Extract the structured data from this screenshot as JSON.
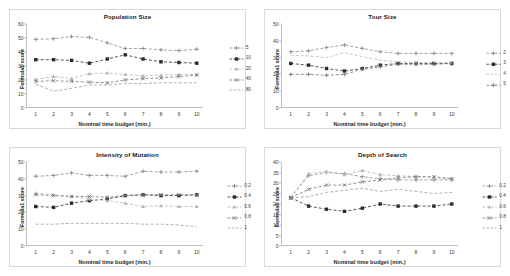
{
  "figure": {
    "background": "#ffffff",
    "panel_border": "#d9d9d9",
    "axis_color": "#bfbfbf",
    "shared_xlabel": "Nominal time budget (min.)",
    "shared_ylabel": "Formula1 score",
    "x_categories": [
      1,
      2,
      3,
      4,
      5,
      6,
      7,
      8,
      9,
      10
    ]
  },
  "chart_data": [
    {
      "type": "line",
      "title": "Population Size",
      "xlabel": "Nominal time budget (min.)",
      "ylabel": "Formula1 score",
      "x": [
        1,
        2,
        3,
        4,
        5,
        6,
        7,
        8,
        9,
        10
      ],
      "xlim": [
        1,
        10
      ],
      "ylim": [
        0,
        60
      ],
      "yticks": [
        0,
        10,
        20,
        30,
        40,
        50,
        60
      ],
      "grid": false,
      "legend_position": "right",
      "series": [
        {
          "name": "5",
          "color": "#8a8a8a",
          "marker": "plus",
          "values": [
            49.0,
            49.5,
            51.0,
            50.5,
            46.5,
            42.5,
            42.5,
            41.5,
            41.0,
            42.0
          ]
        },
        {
          "name": "10",
          "color": "#2b2b2b",
          "marker": "square",
          "values": [
            34.5,
            34.5,
            34.0,
            32.0,
            35.0,
            38.0,
            35.0,
            33.0,
            32.5,
            32.0
          ]
        },
        {
          "name": "20",
          "color": "#b5b5b5",
          "marker": "triangle",
          "values": [
            20.5,
            22.5,
            21.0,
            24.5,
            25.0,
            24.0,
            23.0,
            23.5,
            24.0,
            24.0
          ]
        },
        {
          "name": "40",
          "color": "#777777",
          "marker": "cross",
          "values": [
            19.0,
            19.5,
            19.0,
            18.5,
            18.0,
            20.0,
            21.0,
            21.5,
            22.5,
            23.5
          ]
        },
        {
          "name": "80",
          "color": "#9d9d9d",
          "marker": "none",
          "values": [
            17.0,
            12.0,
            14.0,
            16.5,
            16.5,
            17.5,
            17.5,
            18.0,
            18.0,
            18.0
          ]
        }
      ]
    },
    {
      "type": "line",
      "title": "Tour Size",
      "xlabel": "Nominal time budget (min.)",
      "ylabel": "Formula1 score",
      "x": [
        1,
        2,
        3,
        4,
        5,
        6,
        7,
        8,
        9,
        10
      ],
      "xlim": [
        1,
        10
      ],
      "ylim": [
        0,
        50
      ],
      "yticks": [
        0,
        10,
        20,
        30,
        40,
        50
      ],
      "grid": false,
      "legend_position": "right",
      "series": [
        {
          "name": "2",
          "color": "#8a8a8a",
          "marker": "plus",
          "values": [
            33.5,
            34.0,
            36.0,
            37.5,
            35.5,
            33.5,
            32.5,
            32.5,
            32.5,
            32.5
          ]
        },
        {
          "name": "3",
          "color": "#2b2b2b",
          "marker": "square",
          "values": [
            26.5,
            25.5,
            23.5,
            22.0,
            23.5,
            25.5,
            26.5,
            26.5,
            26.5,
            26.5
          ]
        },
        {
          "name": "4",
          "color": "#b5b5b5",
          "marker": "none",
          "values": [
            31.5,
            31.0,
            30.0,
            33.0,
            30.5,
            28.5,
            27.5,
            27.0,
            27.0,
            27.0
          ]
        },
        {
          "name": "5",
          "color": "#777777",
          "marker": "plus",
          "values": [
            20.0,
            20.0,
            19.5,
            20.0,
            23.0,
            24.5,
            26.0,
            26.0,
            26.0,
            26.5
          ]
        }
      ]
    },
    {
      "type": "line",
      "title": "Intensity of Mutation",
      "xlabel": "Nominal time budget (min.)",
      "ylabel": "Formula1 score",
      "x": [
        1,
        2,
        3,
        4,
        5,
        6,
        7,
        8,
        9,
        10
      ],
      "xlim": [
        1,
        10
      ],
      "ylim": [
        0,
        50
      ],
      "yticks": [
        0,
        10,
        20,
        30,
        40,
        50
      ],
      "grid": false,
      "legend_position": "right",
      "series": [
        {
          "name": "0.2",
          "color": "#8a8a8a",
          "marker": "plus",
          "values": [
            41.5,
            42.0,
            43.5,
            42.0,
            42.0,
            41.5,
            44.5,
            44.0,
            44.0,
            44.5
          ]
        },
        {
          "name": "0.4",
          "color": "#2b2b2b",
          "marker": "square",
          "values": [
            23.5,
            23.0,
            25.5,
            27.0,
            28.0,
            30.0,
            30.5,
            30.0,
            30.0,
            30.5
          ]
        },
        {
          "name": "0.6",
          "color": "#b5b5b5",
          "marker": "triangle",
          "values": [
            31.5,
            30.5,
            29.5,
            28.0,
            27.0,
            25.5,
            23.5,
            24.0,
            23.5,
            23.5
          ]
        },
        {
          "name": "0.8",
          "color": "#777777",
          "marker": "cross",
          "values": [
            30.5,
            30.0,
            29.5,
            29.5,
            29.0,
            30.0,
            30.5,
            30.5,
            30.5,
            30.5
          ]
        },
        {
          "name": "1",
          "color": "#9d9d9d",
          "marker": "none",
          "values": [
            13.0,
            13.0,
            13.5,
            13.5,
            13.5,
            13.5,
            13.0,
            13.0,
            12.5,
            11.5
          ]
        }
      ]
    },
    {
      "type": "line",
      "title": "Depth of Search",
      "xlabel": "Nominal time budget (min.)",
      "ylabel": "Formula1 score",
      "x": [
        1,
        2,
        3,
        4,
        5,
        6,
        7,
        8,
        9,
        10
      ],
      "xlim": [
        1,
        10
      ],
      "ylim": [
        0,
        40
      ],
      "yticks": [
        0,
        5,
        10,
        15,
        20,
        25,
        30,
        35,
        40
      ],
      "grid": false,
      "legend_position": "right",
      "series": [
        {
          "name": "0.2",
          "color": "#8a8a8a",
          "marker": "plus",
          "values": [
            23.0,
            33.5,
            35.0,
            34.5,
            33.0,
            32.0,
            31.5,
            31.5,
            31.5,
            31.5
          ]
        },
        {
          "name": "0.4",
          "color": "#2b2b2b",
          "marker": "square",
          "values": [
            23.0,
            19.0,
            17.5,
            16.5,
            18.0,
            20.0,
            19.0,
            19.0,
            19.0,
            20.0
          ]
        },
        {
          "name": "0.6",
          "color": "#b5b5b5",
          "marker": "triangle",
          "values": [
            23.0,
            34.5,
            35.5,
            34.0,
            36.0,
            34.0,
            33.5,
            33.0,
            32.5,
            32.0
          ]
        },
        {
          "name": "0.8",
          "color": "#777777",
          "marker": "cross",
          "values": [
            23.0,
            27.0,
            29.0,
            29.0,
            30.5,
            31.5,
            32.5,
            33.0,
            33.0,
            32.0
          ]
        },
        {
          "name": "1",
          "color": "#9d9d9d",
          "marker": "none",
          "values": [
            23.0,
            23.5,
            25.5,
            26.5,
            27.5,
            26.0,
            27.0,
            26.0,
            25.0,
            25.5
          ]
        }
      ]
    }
  ]
}
